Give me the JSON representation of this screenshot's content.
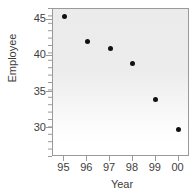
{
  "chart_data": {
    "type": "scatter",
    "title": "",
    "subtitle": "",
    "xlabel": "Year",
    "ylabel": "Employee",
    "categories": [
      "95",
      "96",
      "97",
      "98",
      "99",
      "00"
    ],
    "x": [
      95,
      96,
      97,
      98,
      99,
      100
    ],
    "values": [
      45.5,
      42.0,
      41.0,
      39.0,
      34.0,
      29.8
    ],
    "series": [
      {
        "name": "Employee",
        "values": [
          45.5,
          42.0,
          41.0,
          39.0,
          34.0,
          29.8
        ]
      }
    ],
    "points": [
      {
        "label": "95",
        "x": 95,
        "y": 45.5
      },
      {
        "label": "96",
        "x": 96,
        "y": 42.0
      },
      {
        "label": "97",
        "x": 97,
        "y": 41.0
      },
      {
        "label": "98",
        "x": 98,
        "y": 39.0
      },
      {
        "label": "99",
        "x": 99,
        "y": 34.0
      },
      {
        "label": "00",
        "x": 100,
        "y": 29.8
      }
    ],
    "ytick_labels": [
      "45",
      "40",
      "35",
      "30"
    ],
    "ytick_values": [
      45,
      40,
      35,
      30
    ],
    "xtick_labels": [
      "95",
      "96",
      "97",
      "98",
      "99",
      "00"
    ],
    "ylim": [
      26.0,
      46.5
    ],
    "xlim": [
      94.5,
      100.5
    ],
    "grid": false,
    "legend": false,
    "legend_position": "none",
    "marker_color": "#111111",
    "panel_color": "#ececec",
    "axis_color": "#9a9a9a",
    "text_color": "#3d3d3d",
    "minor_ticks_y": true,
    "minor_tick_count_y": 20,
    "annotations": []
  }
}
